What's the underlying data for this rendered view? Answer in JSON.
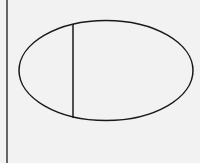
{
  "diagram": {
    "background": "#f2f2f2",
    "stroke_color": "#1a1a1a",
    "border_line": {
      "x": 7,
      "y1": 0,
      "y2": 163
    },
    "ellipse": {
      "cx": 106,
      "cy": 70.5,
      "rx": 87,
      "ry": 50
    },
    "chord": {
      "x": 73,
      "y1": 24,
      "y2": 118
    }
  }
}
